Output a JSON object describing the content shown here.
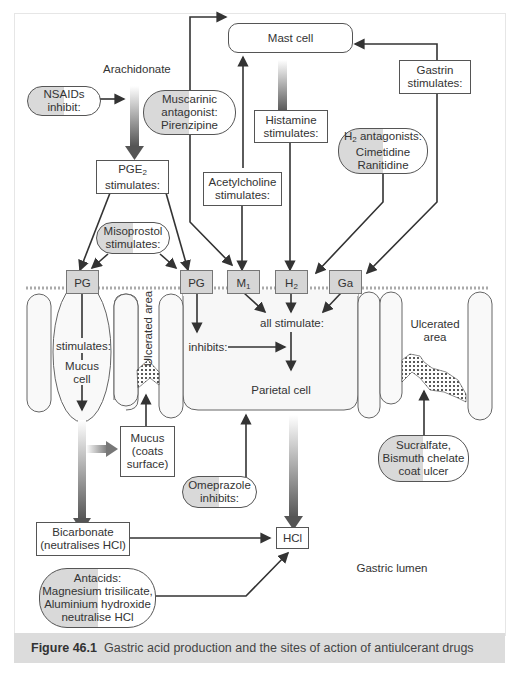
{
  "figure": {
    "caption_label": "Figure 46.1",
    "caption_text": "Gastric acid production and the sites of action of antiulcerant drugs"
  },
  "nodes": {
    "arachidonate": "Arachidonate",
    "nsaids": [
      "NSAIDs",
      "inhibit:"
    ],
    "pge2": [
      "PGE",
      "2",
      "stimulates:"
    ],
    "muscarinic": [
      "Muscarinic",
      "antagonist:",
      "Pirenzipine"
    ],
    "mast_cell": "Mast cell",
    "histamine": [
      "Histamine",
      "stimulates:"
    ],
    "gastrin": [
      "Gastrin",
      "stimulates:"
    ],
    "h2_antagonists": [
      "H",
      "2",
      " antagonists:",
      "Cimetidine",
      "Ranitidine"
    ],
    "acetylcholine": [
      "Acetylcholine",
      "stimulates:"
    ],
    "misoprostol": [
      "Misoprostol",
      "stimulates:"
    ],
    "all_stimulate": "all stimulate:",
    "inhibits": "inhibits:",
    "parietal_cell": "Parietal cell",
    "mucus_cell_stimulates": "stimulates:",
    "mucus_cell": [
      "Mucus",
      "cell"
    ],
    "ulcerated_area_vertical": "Ulcerated area",
    "ulcerated_area_right": [
      "Ulcerated",
      "area"
    ],
    "mucus": [
      "Mucus",
      "(coats",
      "surface)"
    ],
    "omeprazole": [
      "Omeprazole",
      "inhibits:"
    ],
    "sucralfate": [
      "Sucralfate,",
      "Bismuth chelate",
      "coat ulcer"
    ],
    "bicarbonate": [
      "Bicarbonate",
      "(neutralises HCl)"
    ],
    "hcl": "HCl",
    "antacids": [
      "Antacids:",
      "Magnesium trisilicate,",
      "Aluminium hydroxide",
      "neutralise HCl"
    ],
    "gastric_lumen": "Gastric lumen"
  },
  "receptors": [
    {
      "label": "PG",
      "sub": ""
    },
    {
      "label": "PG",
      "sub": ""
    },
    {
      "label": "M",
      "sub": "1"
    },
    {
      "label": "H",
      "sub": "2"
    },
    {
      "label": "Ga",
      "sub": ""
    }
  ],
  "colors": {
    "line": "#333333",
    "receptor_fill": "#d6d6d6",
    "pill_grey": "#d9d9d9",
    "caption_bar": "#dcdcdc",
    "cell_outline": "#666666"
  }
}
